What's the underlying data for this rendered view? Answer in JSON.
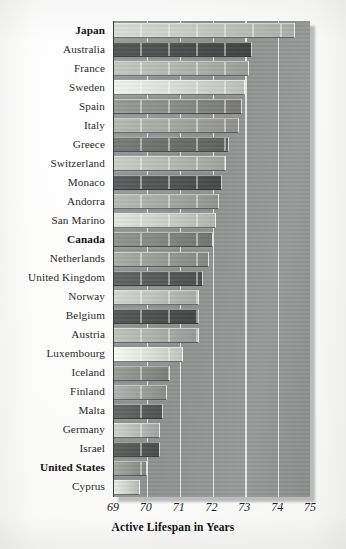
{
  "chart_data": {
    "type": "bar",
    "orientation": "horizontal",
    "title": "",
    "xlabel": "Active Lifespan in Years",
    "ylabel": "",
    "xlim": [
      69,
      75
    ],
    "xticks": [
      69,
      70,
      71,
      72,
      73,
      74,
      75
    ],
    "xtick_labels": [
      "69",
      "70",
      "71",
      "72",
      "73",
      "74",
      "75"
    ],
    "grid": true,
    "grid_axis": "x",
    "legend": "none",
    "categories": [
      "Japan",
      "Australia",
      "France",
      "Sweden",
      "Spain",
      "Italy",
      "Greece",
      "Switzerland",
      "Monaco",
      "Andorra",
      "San Marino",
      "Canada",
      "Netherlands",
      "United Kingdom",
      "Norway",
      "Belgium",
      "Austria",
      "Luxembourg",
      "Iceland",
      "Finland",
      "Malta",
      "Germany",
      "Israel",
      "United States",
      "Cyprus"
    ],
    "values": [
      74.5,
      73.2,
      73.1,
      73.0,
      72.9,
      72.8,
      72.5,
      72.4,
      72.3,
      72.2,
      72.1,
      72.0,
      71.9,
      71.7,
      71.6,
      71.6,
      71.6,
      71.1,
      70.7,
      70.6,
      70.5,
      70.4,
      70.4,
      70.0,
      69.8
    ],
    "emphasized": [
      "Japan",
      "Canada",
      "United States"
    ],
    "bar_colors": [
      "#c9cbc6",
      "#4d4f4f",
      "#b4b6b1",
      "#dcded9",
      "#8b8d8a",
      "#a6a8a4",
      "#6e706e",
      "#b9bbb6",
      "#535555",
      "#a9aba6",
      "#cfd1cc",
      "#858784",
      "#9b9d99",
      "#5a5c5c",
      "#c2c4bf",
      "#4f5151",
      "#b0b2ad",
      "#e2e4df",
      "#8e908c",
      "#a1a39f",
      "#5d5f5f",
      "#bdbfba",
      "#565858",
      "#979995",
      "#d4d6d1"
    ]
  },
  "axis": {
    "xlabel": "Active Lifespan in Years"
  }
}
